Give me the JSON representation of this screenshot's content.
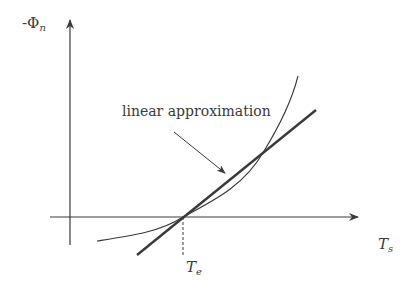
{
  "diagram": {
    "y_axis_label": {
      "prefix": "-Φ",
      "subscript": "n"
    },
    "x_axis_label": {
      "main": "T",
      "subscript": "s"
    },
    "equilibrium_label": {
      "main": "T",
      "subscript": "e"
    },
    "annotation": "linear approximation",
    "colors": {
      "ink": "#3a3a3a",
      "background": "#ffffff"
    },
    "elements": [
      "y-axis with arrow",
      "x-axis with arrow",
      "nonlinear curve",
      "linear approximation line (thick)",
      "dashed drop line at Te",
      "annotation arrow"
    ]
  }
}
